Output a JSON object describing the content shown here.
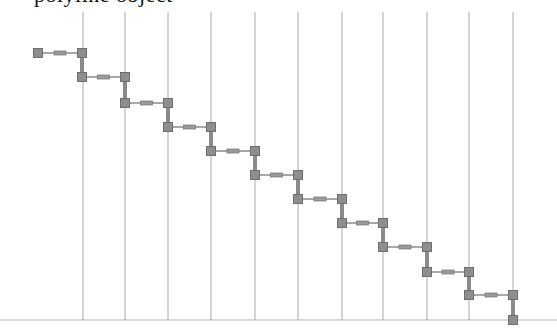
{
  "caption": {
    "text": "polyline object"
  },
  "colors": {
    "background": "#ffffff",
    "grid_line": "#a8a8a8",
    "baseline": "#b0b0b0",
    "segment": "#8a8a8a",
    "node_fill": "#8e8e8e",
    "node_stroke": "#6e6e6e",
    "handle_fill": "#9a9a9a",
    "handle_stroke": "#7a7a7a"
  },
  "diagram": {
    "width": 557,
    "height": 331,
    "grid": {
      "vertical_lines_x": [
        83,
        125,
        168,
        211,
        255,
        298,
        342,
        383,
        427,
        469,
        513
      ],
      "top_y": 12,
      "bottom_y": 320
    },
    "baseline": {
      "y": 320,
      "x1": 0,
      "x2": 557
    },
    "node_size": 9,
    "nodes": [
      {
        "x": 38,
        "y": 53
      },
      {
        "x": 82,
        "y": 53
      },
      {
        "x": 82,
        "y": 77
      },
      {
        "x": 125,
        "y": 77
      },
      {
        "x": 125,
        "y": 103
      },
      {
        "x": 168,
        "y": 103
      },
      {
        "x": 168,
        "y": 127
      },
      {
        "x": 211,
        "y": 127
      },
      {
        "x": 211,
        "y": 151
      },
      {
        "x": 255,
        "y": 151
      },
      {
        "x": 255,
        "y": 175
      },
      {
        "x": 298,
        "y": 175
      },
      {
        "x": 298,
        "y": 199
      },
      {
        "x": 342,
        "y": 199
      },
      {
        "x": 342,
        "y": 223
      },
      {
        "x": 383,
        "y": 223
      },
      {
        "x": 383,
        "y": 247
      },
      {
        "x": 427,
        "y": 247
      },
      {
        "x": 427,
        "y": 272
      },
      {
        "x": 469,
        "y": 272
      },
      {
        "x": 469,
        "y": 295
      },
      {
        "x": 513,
        "y": 295
      },
      {
        "x": 513,
        "y": 320
      }
    ]
  }
}
